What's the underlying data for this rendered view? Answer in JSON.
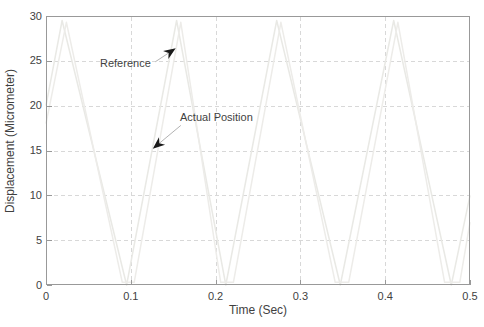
{
  "chart_data": {
    "type": "line",
    "title": "",
    "xlabel": "Time (Sec)",
    "ylabel": "Displacement (Micrometer)",
    "xlim": [
      0,
      0.5
    ],
    "ylim": [
      0,
      30
    ],
    "xtick_values": [
      0,
      0.1,
      0.2,
      0.3,
      0.4,
      0.5
    ],
    "xtick_labels": [
      "0",
      "0.1",
      "0.2",
      "0.3",
      "0.4",
      "0.5"
    ],
    "ytick_values": [
      0,
      5,
      10,
      15,
      20,
      25,
      30
    ],
    "ytick_labels": [
      "0",
      "5",
      "10",
      "15",
      "20",
      "25",
      "30"
    ],
    "grid": true,
    "grid_style": "dashed",
    "grid_color": "#d8d8d8",
    "axis_color": "#999999",
    "text_color": "#3f3f3f",
    "background_color": "#ffffff",
    "series": [
      {
        "name": "Reference",
        "description": "triangular wave, very faint light line, min 0, max 29.5, period approx 0.128 s",
        "color": "#e9e9e5",
        "points": [
          [
            0,
            20
          ],
          [
            0.019,
            29.5
          ],
          [
            0.095,
            0
          ],
          [
            0.154,
            29.5
          ],
          [
            0.212,
            0
          ],
          [
            0.272,
            29.5
          ],
          [
            0.347,
            0
          ],
          [
            0.41,
            29.5
          ],
          [
            0.478,
            0
          ],
          [
            0.5,
            10
          ]
        ]
      },
      {
        "name": "Actual Position",
        "description": "tracking response, very faint light line, slight lag and flattened bottoms",
        "color": "#edece9",
        "points": [
          [
            0,
            18
          ],
          [
            0.024,
            29.3
          ],
          [
            0.09,
            0.3
          ],
          [
            0.104,
            0.3
          ],
          [
            0.159,
            29.3
          ],
          [
            0.206,
            0.3
          ],
          [
            0.221,
            0.3
          ],
          [
            0.277,
            29.3
          ],
          [
            0.341,
            0.3
          ],
          [
            0.357,
            0.3
          ],
          [
            0.415,
            29.3
          ],
          [
            0.47,
            0.3
          ],
          [
            0.488,
            0.3
          ],
          [
            0.5,
            7
          ]
        ]
      }
    ],
    "annotations": [
      {
        "label": "Reference",
        "label_pos": [
          0.064,
          25.4
        ],
        "arrow_from": [
          0.129,
          24.9
        ],
        "arrow_to": [
          0.153,
          26.4
        ],
        "arrow_color": "#b3b3b3",
        "head_color": "#1a1a1a"
      },
      {
        "label": "Actual Position",
        "label_pos": [
          0.158,
          19.4
        ],
        "arrow_from": [
          0.159,
          17.8
        ],
        "arrow_to": [
          0.126,
          15.2
        ],
        "arrow_color": "#b3b3b3",
        "head_color": "#1a1a1a"
      }
    ],
    "legend": "none"
  }
}
